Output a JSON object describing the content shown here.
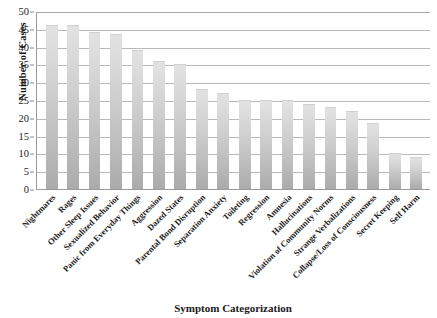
{
  "chart_data": {
    "type": "bar",
    "title": "",
    "xlabel": "Symptom Categorization",
    "ylabel": "Number of Cases",
    "ylim": [
      0,
      50
    ],
    "ytick_step": 5,
    "yticks": [
      0,
      5,
      10,
      15,
      20,
      25,
      30,
      35,
      40,
      45,
      50
    ],
    "grid": true,
    "legend": false,
    "orientation": "vertical",
    "bar_color": "#cfcfcf",
    "categories": [
      "Nightmares",
      "Rages",
      "Other Sleep Issues",
      "Sexualized Behavior",
      "Panic from Everyday Things",
      "Aggression",
      "Dazed States",
      "Parental Bond Disruption",
      "Separation Anxiety",
      "Toileting",
      "Regression",
      "Amnesia",
      "Hallucinations",
      "Violation of Community Norms",
      "Strange Verbalizations",
      "Collapse/Loss of Consciousness",
      "Secret Keeping",
      "Self Harm"
    ],
    "values": [
      46,
      46,
      44,
      43.5,
      39,
      36,
      35,
      28,
      27,
      25,
      25,
      25,
      24,
      23,
      22,
      18.5,
      10,
      9
    ]
  },
  "axes": {
    "y_title": "Number of Cases",
    "x_title": "Symptom Categorization"
  }
}
